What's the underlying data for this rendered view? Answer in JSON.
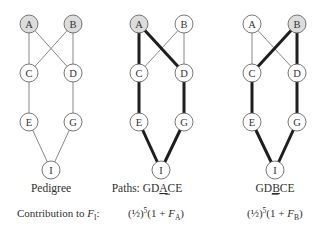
{
  "figure": {
    "style": {
      "node_radius": 9,
      "node_fill": "#ffffff",
      "ancestor_fill": "#dcdcdc",
      "node_stroke": "#555555",
      "thin_edge_color": "#7a7a7a",
      "thin_edge_width": 0.9,
      "path_edge_color": "#1e1e1e",
      "path_edge_width": 3
    },
    "panels": [
      {
        "id": "pedigree",
        "label": "Pedigree",
        "label_x": 51,
        "label_y": 192,
        "nodes": [
          {
            "id": "A",
            "label": "A",
            "x": 29,
            "y": 24,
            "shaded": true
          },
          {
            "id": "B",
            "label": "B",
            "x": 73,
            "y": 24,
            "shaded": true
          },
          {
            "id": "C",
            "label": "C",
            "x": 29,
            "y": 73,
            "shaded": false
          },
          {
            "id": "D",
            "label": "D",
            "x": 73,
            "y": 73,
            "shaded": false
          },
          {
            "id": "E",
            "label": "E",
            "x": 29,
            "y": 122,
            "shaded": false
          },
          {
            "id": "G",
            "label": "G",
            "x": 73,
            "y": 122,
            "shaded": false
          },
          {
            "id": "I",
            "label": "I",
            "x": 51,
            "y": 170,
            "shaded": false
          }
        ],
        "edges": [
          {
            "from": "A",
            "to": "C",
            "bold": false
          },
          {
            "from": "A",
            "to": "D",
            "bold": false
          },
          {
            "from": "B",
            "to": "C",
            "bold": false
          },
          {
            "from": "B",
            "to": "D",
            "bold": false
          },
          {
            "from": "C",
            "to": "E",
            "bold": false
          },
          {
            "from": "D",
            "to": "G",
            "bold": false
          },
          {
            "from": "E",
            "to": "I",
            "bold": false
          },
          {
            "from": "G",
            "to": "I",
            "bold": false
          }
        ]
      },
      {
        "id": "path-gdace",
        "label_prefix": "Paths: GD",
        "label_underlined": "A",
        "label_suffix": "CE",
        "label_x": 147,
        "label_y": 192,
        "nodes": [
          {
            "id": "A",
            "label": "A",
            "x": 139,
            "y": 24,
            "shaded": true
          },
          {
            "id": "B",
            "label": "B",
            "x": 184,
            "y": 24,
            "shaded": false
          },
          {
            "id": "C",
            "label": "C",
            "x": 139,
            "y": 73,
            "shaded": false
          },
          {
            "id": "D",
            "label": "D",
            "x": 184,
            "y": 73,
            "shaded": false
          },
          {
            "id": "E",
            "label": "E",
            "x": 139,
            "y": 122,
            "shaded": false
          },
          {
            "id": "G",
            "label": "G",
            "x": 184,
            "y": 122,
            "shaded": false
          },
          {
            "id": "I",
            "label": "I",
            "x": 161,
            "y": 170,
            "shaded": false
          }
        ],
        "edges": [
          {
            "from": "B",
            "to": "C",
            "bold": false
          },
          {
            "from": "B",
            "to": "D",
            "bold": false
          },
          {
            "from": "A",
            "to": "C",
            "bold": true
          },
          {
            "from": "A",
            "to": "D",
            "bold": true
          },
          {
            "from": "C",
            "to": "E",
            "bold": true
          },
          {
            "from": "D",
            "to": "G",
            "bold": true
          },
          {
            "from": "E",
            "to": "I",
            "bold": true
          },
          {
            "from": "G",
            "to": "I",
            "bold": true
          }
        ]
      },
      {
        "id": "path-gdbce",
        "label_prefix": "GD",
        "label_underlined": "B",
        "label_suffix": "CE",
        "label_x": 275,
        "label_y": 192,
        "nodes": [
          {
            "id": "A",
            "label": "A",
            "x": 252,
            "y": 24,
            "shaded": false
          },
          {
            "id": "B",
            "label": "B",
            "x": 297,
            "y": 24,
            "shaded": true
          },
          {
            "id": "C",
            "label": "C",
            "x": 252,
            "y": 73,
            "shaded": false
          },
          {
            "id": "D",
            "label": "D",
            "x": 297,
            "y": 73,
            "shaded": false
          },
          {
            "id": "E",
            "label": "E",
            "x": 252,
            "y": 122,
            "shaded": false
          },
          {
            "id": "G",
            "label": "G",
            "x": 297,
            "y": 122,
            "shaded": false
          },
          {
            "id": "I",
            "label": "I",
            "x": 275,
            "y": 170,
            "shaded": false
          }
        ],
        "edges": [
          {
            "from": "A",
            "to": "C",
            "bold": false
          },
          {
            "from": "A",
            "to": "D",
            "bold": false
          },
          {
            "from": "B",
            "to": "C",
            "bold": true
          },
          {
            "from": "B",
            "to": "D",
            "bold": true
          },
          {
            "from": "C",
            "to": "E",
            "bold": true
          },
          {
            "from": "D",
            "to": "G",
            "bold": true
          },
          {
            "from": "E",
            "to": "I",
            "bold": true
          },
          {
            "from": "G",
            "to": "I",
            "bold": true
          }
        ]
      }
    ],
    "contribution": {
      "label_prefix": "Contribution to ",
      "label_var": "F",
      "label_sub": "I",
      "label_colon": ":",
      "formulas": [
        {
          "x": 128,
          "half": "(½)",
          "exp": "5",
          "body": "(1 + ",
          "var": "F",
          "sub": "A",
          "close": ")"
        },
        {
          "x": 247,
          "half": "(½)",
          "exp": "5",
          "body": "(1 + ",
          "var": "F",
          "sub": "B",
          "close": ")"
        }
      ]
    }
  }
}
